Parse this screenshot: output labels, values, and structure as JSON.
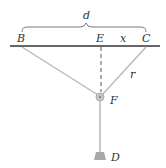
{
  "labels": {
    "d": "d",
    "B": "B",
    "E": "E",
    "x": "x",
    "C": "C",
    "r": "r",
    "F": "F",
    "D": "D"
  },
  "colors": {
    "bar": "#333333",
    "rope": "#b8b8b8",
    "dashed": "#555555",
    "pulley": "#b0b0b0",
    "weight": "#a8a8a8",
    "text": "#333333"
  },
  "points": {
    "B": [
      22,
      46
    ],
    "E": [
      101,
      46
    ],
    "C": [
      146,
      46
    ],
    "F": [
      100,
      97
    ],
    "D": [
      100,
      158
    ]
  }
}
